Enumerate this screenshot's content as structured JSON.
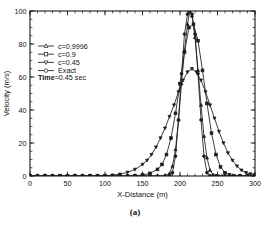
{
  "figure": {
    "caption": "(a)",
    "annotation": {
      "bold_prefix": "Time",
      "rest": "=0.45 sec"
    }
  },
  "chart_data": {
    "type": "line",
    "title": "",
    "xlabel": "X-Distance (m)",
    "ylabel": "Velocity (m/s)",
    "xlim": [
      0,
      300
    ],
    "ylim": [
      0,
      100
    ],
    "xticks": [
      0,
      50,
      100,
      150,
      200,
      250,
      300
    ],
    "xticklabels": [
      "0",
      "50",
      "100",
      "150",
      "200",
      "250",
      "300"
    ],
    "yticks": [
      0,
      20,
      40,
      60,
      80,
      100
    ],
    "yticklabels": [
      "0",
      "20",
      "40",
      "60",
      "80",
      "100"
    ],
    "xminor_step": 10,
    "yminor_step": 5,
    "grid": false,
    "legend_position": "upper-left",
    "annotations": [
      {
        "text": "Time=0.45 sec",
        "x": 28,
        "y": 72
      }
    ],
    "series": [
      {
        "name": "c=0.9996",
        "marker": "triangle-up",
        "x": [
          0,
          10,
          20,
          30,
          40,
          50,
          60,
          70,
          80,
          90,
          100,
          110,
          120,
          130,
          140,
          150,
          160,
          170,
          180,
          186,
          190,
          194,
          198,
          202,
          206,
          210,
          213,
          216,
          220,
          224,
          228,
          232,
          236,
          240,
          244,
          248,
          252,
          256,
          260,
          270,
          280,
          290,
          300
        ],
        "y": [
          0,
          0,
          0,
          0,
          0,
          0,
          0,
          0,
          0,
          0,
          0,
          0,
          0,
          0,
          0,
          0,
          0,
          0,
          0.3,
          1.5,
          6,
          16,
          34,
          56,
          76,
          92,
          100,
          97,
          84,
          64,
          43,
          24,
          11,
          3.5,
          0.8,
          0.2,
          0,
          0,
          0,
          0,
          0,
          0,
          0
        ]
      },
      {
        "name": "c=0.9",
        "marker": "square",
        "x": [
          0,
          10,
          20,
          30,
          40,
          50,
          60,
          70,
          80,
          90,
          100,
          110,
          120,
          130,
          140,
          150,
          160,
          170,
          176,
          182,
          188,
          194,
          200,
          206,
          212,
          218,
          224,
          230,
          236,
          242,
          248,
          254,
          260,
          266,
          272,
          280,
          290,
          300
        ],
        "y": [
          0,
          0,
          0,
          0,
          0,
          0,
          0,
          0,
          0,
          0,
          0,
          0,
          0,
          0,
          0.2,
          0.6,
          1.6,
          4,
          7,
          13,
          23,
          38,
          56,
          75,
          90,
          92,
          82,
          64,
          44,
          26,
          13,
          5.5,
          2,
          0.7,
          0.2,
          0,
          0,
          0
        ]
      },
      {
        "name": "c=0.45",
        "marker": "triangle-down",
        "x": [
          0,
          10,
          20,
          30,
          40,
          50,
          60,
          70,
          80,
          90,
          100,
          110,
          120,
          130,
          140,
          150,
          156,
          162,
          168,
          174,
          180,
          186,
          192,
          198,
          204,
          210,
          216,
          222,
          228,
          234,
          240,
          246,
          252,
          258,
          264,
          270,
          276,
          282,
          288,
          294,
          300
        ],
        "y": [
          0,
          0,
          0,
          0,
          0,
          0,
          0,
          0,
          0,
          0,
          0.2,
          0.5,
          1.1,
          2.2,
          4,
          7,
          9.5,
          13,
          17.5,
          23,
          29,
          36,
          43,
          51,
          58,
          63,
          65,
          63,
          58,
          51,
          43,
          35,
          27,
          20,
          14,
          9.5,
          6,
          3.5,
          2,
          1.2,
          0.8
        ]
      },
      {
        "name": "Exact",
        "marker": "circle",
        "x": [
          0,
          20,
          40,
          60,
          80,
          100,
          120,
          140,
          150,
          160,
          170,
          180,
          186,
          190,
          194,
          198,
          202,
          206,
          210,
          213,
          216,
          220,
          224,
          228,
          232,
          236,
          240,
          244,
          248,
          260,
          280,
          300
        ],
        "y": [
          0,
          0,
          0,
          0,
          0,
          0,
          0,
          0,
          0,
          0,
          0,
          0,
          0,
          2,
          12,
          34,
          62,
          86,
          98,
          100,
          98,
          86,
          62,
          34,
          12,
          2,
          0,
          0,
          0,
          0,
          0,
          0
        ]
      }
    ]
  },
  "legend": {
    "items": [
      {
        "label": "c=0.9996",
        "marker": "triangle-up"
      },
      {
        "label": "c=0.9",
        "marker": "square"
      },
      {
        "label": "c=0.45",
        "marker": "triangle-down"
      },
      {
        "label": "Exact",
        "marker": "circle"
      }
    ]
  }
}
